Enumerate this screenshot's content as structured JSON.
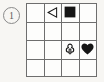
{
  "figure": {
    "label": "1",
    "label_style": "circled-number",
    "type": "grid-puzzle"
  },
  "grid": {
    "rows": 4,
    "columns": 4,
    "line_color": "#6e6e6e",
    "cell_fill": "#fdfdfc",
    "cells": [
      [
        {
          "symbol": "empty",
          "glyph": "",
          "fill": "none"
        },
        {
          "symbol": "triangle-left",
          "glyph": "◁",
          "fill": "outline"
        },
        {
          "symbol": "square",
          "glyph": "■",
          "fill": "solid"
        },
        {
          "symbol": "empty",
          "glyph": "",
          "fill": "none"
        }
      ],
      [
        {
          "symbol": "empty",
          "glyph": "",
          "fill": "none"
        },
        {
          "symbol": "empty",
          "glyph": "",
          "fill": "none"
        },
        {
          "symbol": "empty",
          "glyph": "",
          "fill": "none"
        },
        {
          "symbol": "empty",
          "glyph": "",
          "fill": "none"
        }
      ],
      [
        {
          "symbol": "empty",
          "glyph": "",
          "fill": "none"
        },
        {
          "symbol": "empty",
          "glyph": "",
          "fill": "none"
        },
        {
          "symbol": "club",
          "glyph": "♧",
          "fill": "outline"
        },
        {
          "symbol": "heart",
          "glyph": "♥",
          "fill": "solid"
        }
      ],
      [
        {
          "symbol": "empty",
          "glyph": "",
          "fill": "none"
        },
        {
          "symbol": "empty",
          "glyph": "",
          "fill": "none"
        },
        {
          "symbol": "empty",
          "glyph": "",
          "fill": "none"
        },
        {
          "symbol": "empty",
          "glyph": "",
          "fill": "none"
        }
      ]
    ]
  },
  "colors": {
    "background": "#f7f6f3",
    "ink": "#151515",
    "grid_line": "#6e6e6e",
    "label_ink": "#5d5d5d"
  }
}
